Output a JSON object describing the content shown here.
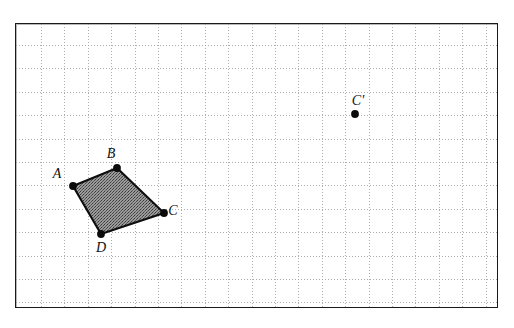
{
  "caption": {
    "text": "of this transformation"
  },
  "figure": {
    "name": "coordinate-grid-quadrilateral",
    "frame": {
      "x": 15,
      "y": 23,
      "width": 483,
      "height": 285
    },
    "grid": {
      "visible": true,
      "style": "dotted",
      "color": "#9e9e9e",
      "spacing_px": 23.4,
      "origin_offset_x": 25,
      "origin_offset_y": 21,
      "cols": 20,
      "rows": 12
    },
    "border_color": "#1a1a1a",
    "background_color": "#ffffff",
    "fill_color": "#8a8a8a",
    "stroke_color": "#0d0d0d"
  },
  "chart_data": {
    "type": "scatter",
    "title": "",
    "xlabel": "",
    "ylabel": "",
    "grid": true,
    "legend": "none",
    "shapes": [
      {
        "name": "quadrilateral-ABCD",
        "kind": "polygon",
        "closed": true,
        "fill": "stipple-gray",
        "vertices": [
          {
            "label": "A",
            "x": 57,
            "y": 162,
            "label_dx": -16,
            "label_dy": -8
          },
          {
            "label": "B",
            "x": 101,
            "y": 144,
            "label_dx": -6,
            "label_dy": -10
          },
          {
            "label": "C",
            "x": 148,
            "y": 189,
            "label_dx": 9,
            "label_dy": 2
          },
          {
            "label": "D",
            "x": 85,
            "y": 210,
            "label_dx": 0,
            "label_dy": 18
          }
        ]
      }
    ],
    "points": [
      {
        "label": "C'",
        "x": 339,
        "y": 90,
        "label_dx": 3,
        "label_dy": -9
      }
    ]
  }
}
